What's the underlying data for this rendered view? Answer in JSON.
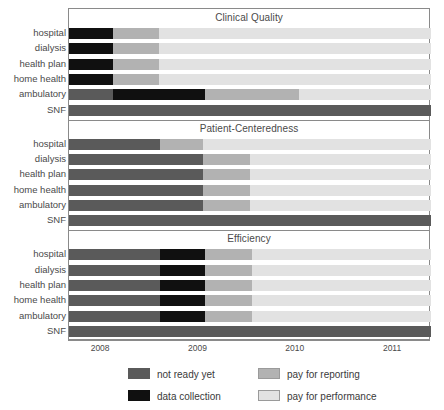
{
  "chart_data": {
    "type": "bar",
    "orientation": "horizontal",
    "subtype": "stacked-timeline",
    "title": "",
    "xlabel": "",
    "ylabel": "",
    "xlim": [
      2007.67,
      2011.39
    ],
    "grid": false,
    "legend_position": "bottom",
    "x_ticks": [
      2008,
      2009,
      2010,
      2011
    ],
    "x_tick_labels": [
      "2008",
      "2009",
      "2010",
      "2011"
    ],
    "categories": [
      "hospital",
      "dialysis",
      "health plan",
      "home health",
      "ambulatory",
      "SNF"
    ],
    "legend": [
      {
        "key": "not_ready",
        "label": "not ready yet",
        "color": "#5a5a5a"
      },
      {
        "key": "data_coll",
        "label": "data collection",
        "color": "#101010"
      },
      {
        "key": "pay_report",
        "label": "pay for reporting",
        "color": "#b2b2b2"
      },
      {
        "key": "pay_perform",
        "label": "pay for performance",
        "color": "#e2e2e2"
      }
    ],
    "panels": [
      {
        "title": "Clinical Quality",
        "rows": [
          {
            "category": "hospital",
            "segments": [
              {
                "key": "data_coll",
                "start": 2007.67,
                "end": 2008.12
              },
              {
                "key": "pay_report",
                "start": 2008.12,
                "end": 2008.59
              },
              {
                "key": "pay_perform",
                "start": 2008.59,
                "end": 2011.39
              }
            ]
          },
          {
            "category": "dialysis",
            "segments": [
              {
                "key": "data_coll",
                "start": 2007.67,
                "end": 2008.12
              },
              {
                "key": "pay_report",
                "start": 2008.12,
                "end": 2008.59
              },
              {
                "key": "pay_perform",
                "start": 2008.59,
                "end": 2011.39
              }
            ]
          },
          {
            "category": "health plan",
            "segments": [
              {
                "key": "data_coll",
                "start": 2007.67,
                "end": 2008.12
              },
              {
                "key": "pay_report",
                "start": 2008.12,
                "end": 2008.59
              },
              {
                "key": "pay_perform",
                "start": 2008.59,
                "end": 2011.39
              }
            ]
          },
          {
            "category": "home health",
            "segments": [
              {
                "key": "data_coll",
                "start": 2007.67,
                "end": 2008.12
              },
              {
                "key": "pay_report",
                "start": 2008.12,
                "end": 2008.59
              },
              {
                "key": "pay_perform",
                "start": 2008.59,
                "end": 2011.39
              }
            ]
          },
          {
            "category": "ambulatory",
            "segments": [
              {
                "key": "not_ready",
                "start": 2007.67,
                "end": 2008.12
              },
              {
                "key": "data_coll",
                "start": 2008.12,
                "end": 2009.07
              },
              {
                "key": "pay_report",
                "start": 2009.07,
                "end": 2010.03
              },
              {
                "key": "pay_perform",
                "start": 2010.03,
                "end": 2011.39
              }
            ]
          },
          {
            "category": "SNF",
            "segments": [
              {
                "key": "not_ready",
                "start": 2007.67,
                "end": 2011.39
              }
            ]
          }
        ]
      },
      {
        "title": "Patient-Centeredness",
        "rows": [
          {
            "category": "hospital",
            "segments": [
              {
                "key": "not_ready",
                "start": 2007.67,
                "end": 2008.61
              },
              {
                "key": "pay_report",
                "start": 2008.61,
                "end": 2009.05
              },
              {
                "key": "pay_perform",
                "start": 2009.05,
                "end": 2011.39
              }
            ]
          },
          {
            "category": "dialysis",
            "segments": [
              {
                "key": "not_ready",
                "start": 2007.67,
                "end": 2009.05
              },
              {
                "key": "pay_report",
                "start": 2009.05,
                "end": 2009.53
              },
              {
                "key": "pay_perform",
                "start": 2009.53,
                "end": 2011.39
              }
            ]
          },
          {
            "category": "health plan",
            "segments": [
              {
                "key": "not_ready",
                "start": 2007.67,
                "end": 2009.05
              },
              {
                "key": "pay_report",
                "start": 2009.05,
                "end": 2009.53
              },
              {
                "key": "pay_perform",
                "start": 2009.53,
                "end": 2011.39
              }
            ]
          },
          {
            "category": "home health",
            "segments": [
              {
                "key": "not_ready",
                "start": 2007.67,
                "end": 2009.05
              },
              {
                "key": "pay_report",
                "start": 2009.05,
                "end": 2009.53
              },
              {
                "key": "pay_perform",
                "start": 2009.53,
                "end": 2011.39
              }
            ]
          },
          {
            "category": "ambulatory",
            "segments": [
              {
                "key": "not_ready",
                "start": 2007.67,
                "end": 2009.05
              },
              {
                "key": "pay_report",
                "start": 2009.05,
                "end": 2009.53
              },
              {
                "key": "pay_perform",
                "start": 2009.53,
                "end": 2011.39
              }
            ]
          },
          {
            "category": "SNF",
            "segments": [
              {
                "key": "not_ready",
                "start": 2007.67,
                "end": 2011.39
              }
            ]
          }
        ]
      },
      {
        "title": "Efficiency",
        "rows": [
          {
            "category": "hospital",
            "segments": [
              {
                "key": "not_ready",
                "start": 2007.67,
                "end": 2008.61
              },
              {
                "key": "data_coll",
                "start": 2008.61,
                "end": 2009.07
              },
              {
                "key": "pay_report",
                "start": 2009.07,
                "end": 2009.55
              },
              {
                "key": "pay_perform",
                "start": 2009.55,
                "end": 2011.39
              }
            ]
          },
          {
            "category": "dialysis",
            "segments": [
              {
                "key": "not_ready",
                "start": 2007.67,
                "end": 2008.61
              },
              {
                "key": "data_coll",
                "start": 2008.61,
                "end": 2009.07
              },
              {
                "key": "pay_report",
                "start": 2009.07,
                "end": 2009.55
              },
              {
                "key": "pay_perform",
                "start": 2009.55,
                "end": 2011.39
              }
            ]
          },
          {
            "category": "health plan",
            "segments": [
              {
                "key": "not_ready",
                "start": 2007.67,
                "end": 2008.61
              },
              {
                "key": "data_coll",
                "start": 2008.61,
                "end": 2009.07
              },
              {
                "key": "pay_report",
                "start": 2009.07,
                "end": 2009.55
              },
              {
                "key": "pay_perform",
                "start": 2009.55,
                "end": 2011.39
              }
            ]
          },
          {
            "category": "home health",
            "segments": [
              {
                "key": "not_ready",
                "start": 2007.67,
                "end": 2008.61
              },
              {
                "key": "data_coll",
                "start": 2008.61,
                "end": 2009.07
              },
              {
                "key": "pay_report",
                "start": 2009.07,
                "end": 2009.55
              },
              {
                "key": "pay_perform",
                "start": 2009.55,
                "end": 2011.39
              }
            ]
          },
          {
            "category": "ambulatory",
            "segments": [
              {
                "key": "not_ready",
                "start": 2007.67,
                "end": 2008.61
              },
              {
                "key": "data_coll",
                "start": 2008.61,
                "end": 2009.07
              },
              {
                "key": "pay_report",
                "start": 2009.07,
                "end": 2009.55
              },
              {
                "key": "pay_perform",
                "start": 2009.55,
                "end": 2011.39
              }
            ]
          },
          {
            "category": "SNF",
            "segments": [
              {
                "key": "not_ready",
                "start": 2007.67,
                "end": 2011.39
              }
            ]
          }
        ]
      }
    ]
  }
}
